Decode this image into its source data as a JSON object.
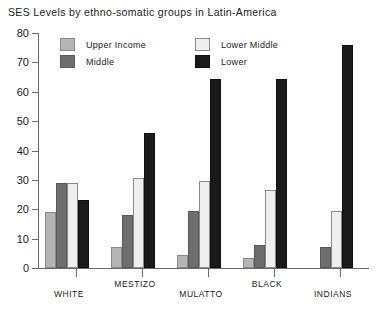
{
  "chart_data": {
    "type": "bar",
    "title": "SES Levels by ethno-somatic groups in Latin-America",
    "xlabel": "",
    "ylabel": "",
    "ylim": [
      0,
      80
    ],
    "yticks": [
      0,
      10,
      20,
      30,
      40,
      50,
      60,
      70,
      80
    ],
    "grid": false,
    "legend_position": "top-left-inside",
    "categories": [
      "WHITE",
      "MESTIZO",
      "MULATTO",
      "BLACK",
      "INDIANS"
    ],
    "series": [
      {
        "name": "Upper Income",
        "color": "#b5b5b5",
        "values": [
          19,
          7,
          4.5,
          3.5,
          0
        ]
      },
      {
        "name": "Middle",
        "color": "#6e6e6e",
        "values": [
          29,
          18,
          19.5,
          8,
          7
        ]
      },
      {
        "name": "Lower Middle",
        "color": "#efefef",
        "values": [
          29,
          30.5,
          29.5,
          26.5,
          19.5
        ]
      },
      {
        "name": "Lower",
        "color": "#1a1a1a",
        "values": [
          23,
          46,
          64.5,
          64.5,
          76
        ]
      }
    ],
    "legend_order": [
      "Upper Income",
      "Middle",
      "Lower Middle",
      "Lower"
    ],
    "bar_order": [
      "Upper Income",
      "Middle",
      "Lower Middle",
      "Lower"
    ]
  }
}
